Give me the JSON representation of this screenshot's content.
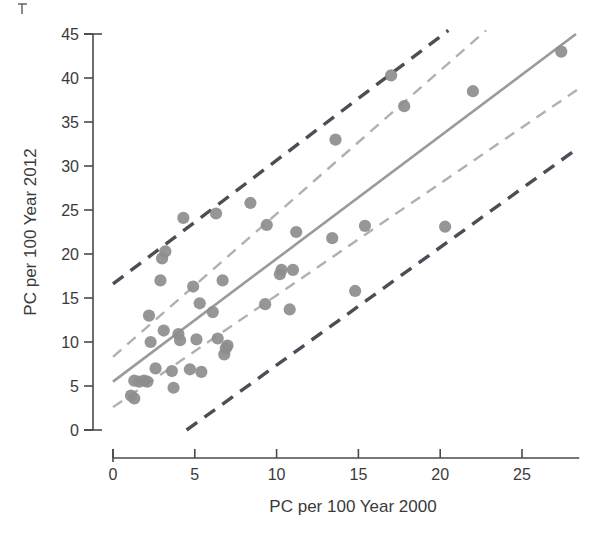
{
  "chart_data": {
    "type": "scatter",
    "title": "",
    "subtitle": "",
    "xlabel": "PC per 100 Year 2000",
    "ylabel": "PC per 100 Year 2012",
    "xlim": [
      0,
      28.5
    ],
    "ylim": [
      0,
      45
    ],
    "xticks": [
      0,
      5,
      10,
      15,
      20,
      25
    ],
    "yticks": [
      0,
      5,
      10,
      15,
      20,
      25,
      30,
      35,
      40,
      45
    ],
    "xtick_labels": [
      "0",
      "5",
      "10",
      "15",
      "20",
      "25"
    ],
    "ytick_labels": [
      "0",
      "5",
      "10",
      "15",
      "20",
      "25",
      "30",
      "35",
      "40",
      "45"
    ],
    "grid": false,
    "legend": "none",
    "marker": {
      "shape": "circle",
      "color": "#8d8d8d",
      "size": 9
    },
    "points": [
      {
        "x": 1.1,
        "y": 3.9
      },
      {
        "x": 1.3,
        "y": 3.6
      },
      {
        "x": 1.3,
        "y": 5.6
      },
      {
        "x": 1.6,
        "y": 5.5
      },
      {
        "x": 1.9,
        "y": 5.6
      },
      {
        "x": 2.1,
        "y": 5.5
      },
      {
        "x": 2.2,
        "y": 13.0
      },
      {
        "x": 2.3,
        "y": 10.0
      },
      {
        "x": 2.6,
        "y": 7.0
      },
      {
        "x": 2.9,
        "y": 17.0
      },
      {
        "x": 3.0,
        "y": 19.5
      },
      {
        "x": 3.1,
        "y": 11.3
      },
      {
        "x": 3.2,
        "y": 20.3
      },
      {
        "x": 3.6,
        "y": 6.7
      },
      {
        "x": 3.7,
        "y": 4.8
      },
      {
        "x": 4.0,
        "y": 10.9
      },
      {
        "x": 4.1,
        "y": 10.2
      },
      {
        "x": 4.3,
        "y": 24.1
      },
      {
        "x": 4.7,
        "y": 6.9
      },
      {
        "x": 4.9,
        "y": 16.3
      },
      {
        "x": 5.1,
        "y": 10.3
      },
      {
        "x": 5.3,
        "y": 14.4
      },
      {
        "x": 5.4,
        "y": 6.6
      },
      {
        "x": 6.1,
        "y": 13.4
      },
      {
        "x": 6.3,
        "y": 24.6
      },
      {
        "x": 6.4,
        "y": 10.4
      },
      {
        "x": 6.7,
        "y": 17.0
      },
      {
        "x": 6.8,
        "y": 8.6
      },
      {
        "x": 6.9,
        "y": 9.3
      },
      {
        "x": 7.0,
        "y": 9.6
      },
      {
        "x": 8.4,
        "y": 25.8
      },
      {
        "x": 9.3,
        "y": 14.3
      },
      {
        "x": 9.4,
        "y": 23.3
      },
      {
        "x": 10.2,
        "y": 17.7
      },
      {
        "x": 10.3,
        "y": 18.2
      },
      {
        "x": 10.8,
        "y": 13.7
      },
      {
        "x": 11.0,
        "y": 18.2
      },
      {
        "x": 11.2,
        "y": 22.5
      },
      {
        "x": 13.4,
        "y": 21.8
      },
      {
        "x": 13.6,
        "y": 33.0
      },
      {
        "x": 14.8,
        "y": 15.8
      },
      {
        "x": 15.4,
        "y": 23.2
      },
      {
        "x": 17.0,
        "y": 40.3
      },
      {
        "x": 17.8,
        "y": 36.8
      },
      {
        "x": 20.3,
        "y": 23.1
      },
      {
        "x": 22.0,
        "y": 38.5
      },
      {
        "x": 27.4,
        "y": 43.0
      }
    ],
    "fit_line": {
      "name": "regression fit",
      "color": "#9a9a9a",
      "style": "solid",
      "x0": 0.0,
      "y0": 5.5,
      "x1": 28.3,
      "y1": 45.0
    },
    "confidence_band": {
      "name": "confidence interval",
      "color": "#b0b0b0",
      "style": "dashed",
      "upper": {
        "x0": 0.0,
        "y0": 8.3,
        "x1": 22.8,
        "y1": 45.4
      },
      "lower": {
        "x0": 0.0,
        "y0": 2.6,
        "x1": 28.4,
        "y1": 38.7
      }
    },
    "prediction_band": {
      "name": "prediction interval",
      "color": "#4d4d57",
      "style": "dashed",
      "upper": {
        "x0": 0.0,
        "y0": 16.6,
        "x1": 20.5,
        "y1": 45.4
      },
      "lower": {
        "x0": 4.5,
        "y0": 0.0,
        "x1": 28.4,
        "y1": 32.0
      }
    }
  },
  "axes": {
    "x_axis_name": "x-axis",
    "y_axis_name": "y-axis"
  }
}
